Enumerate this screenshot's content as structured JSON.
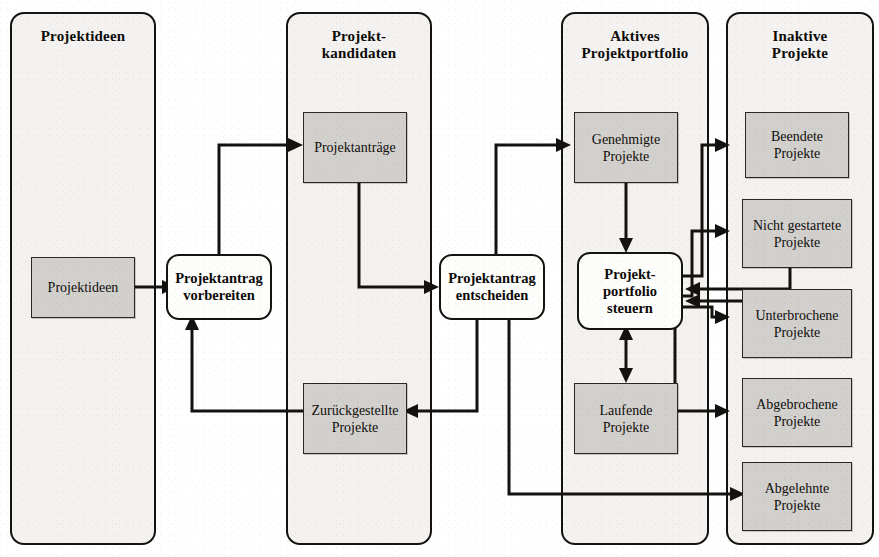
{
  "diagram": {
    "type": "swimlane-flow",
    "colors": {
      "lane_fill": "#f3f2f0",
      "lane_border": "#15130f",
      "node_fill": "#d2d0cd",
      "node_border": "#2a2724",
      "activity_fill": "#fdfdfc",
      "activity_border": "#15130f",
      "connector": "#141210",
      "page_background": "#ffffff"
    }
  },
  "lanes": [
    {
      "id": "lane-projektideen",
      "title": "Projektideen"
    },
    {
      "id": "lane-projektkandidaten",
      "title_line1": "Projekt-",
      "title_line2": "kandidaten"
    },
    {
      "id": "lane-aktives-portfolio",
      "title_line1": "Aktives",
      "title_line2": "Projektportfolio"
    },
    {
      "id": "lane-inaktive-projekte",
      "title_line1": "Inaktive",
      "title_line2": "Projekte"
    }
  ],
  "nodes": {
    "projektideen": {
      "label": "Projektideen"
    },
    "projektantraege": {
      "label": "Projektanträge"
    },
    "zurueckgestellte": {
      "line1": "Zurückgestellte",
      "line2": "Projekte"
    },
    "genehmigte": {
      "line1": "Genehmigte",
      "line2": "Projekte"
    },
    "laufende": {
      "line1": "Laufende",
      "line2": "Projekte"
    },
    "beendete": {
      "line1": "Beendete",
      "line2": "Projekte"
    },
    "nicht_gestartete": {
      "line1": "Nicht gestartete",
      "line2": "Projekte"
    },
    "unterbrochene": {
      "line1": "Unterbrochene",
      "line2": "Projekte"
    },
    "abgebrochene": {
      "line1": "Abgebrochene",
      "line2": "Projekte"
    },
    "abgelehnte": {
      "line1": "Abgelehnte",
      "line2": "Projekte"
    }
  },
  "activities": {
    "antrag_vorbereiten": {
      "line1": "Projektantrag",
      "line2": "vorbereiten"
    },
    "antrag_entscheiden": {
      "line1": "Projektantrag",
      "line2": "entscheiden"
    },
    "portfolio_steuern": {
      "line1": "Projekt-",
      "line2": "portfolio",
      "line3": "steuern"
    }
  },
  "connections": [
    {
      "from": "projektideen",
      "to": "antrag_vorbereiten",
      "style": "straight-right"
    },
    {
      "from": "antrag_vorbereiten",
      "to": "projektantraege",
      "style": "up-right"
    },
    {
      "from": "projektantraege",
      "to": "antrag_entscheiden",
      "style": "down-right"
    },
    {
      "from": "antrag_entscheiden",
      "to": "zurueckgestellte",
      "style": "down-left"
    },
    {
      "from": "zurueckgestellte",
      "to": "antrag_vorbereiten",
      "style": "left-up"
    },
    {
      "from": "antrag_entscheiden",
      "to": "genehmigte",
      "style": "up-right"
    },
    {
      "from": "antrag_entscheiden",
      "to": "abgelehnte",
      "style": "down-right"
    },
    {
      "from": "genehmigte",
      "to": "portfolio_steuern",
      "style": "straight-down"
    },
    {
      "from": "portfolio_steuern",
      "to": "laufende",
      "style": "bidirectional-vertical"
    },
    {
      "from": "portfolio_steuern",
      "to": "beendete",
      "style": "right-up-right"
    },
    {
      "from": "portfolio_steuern",
      "to": "nicht_gestartete",
      "style": "right-up-right"
    },
    {
      "from": "portfolio_steuern",
      "to": "unterbrochene",
      "style": "right-down-right"
    },
    {
      "from": "portfolio_steuern",
      "to": "abgebrochene",
      "style": "right-down-right"
    },
    {
      "from": "nicht_gestartete",
      "to": "portfolio_steuern",
      "style": "feedback-left"
    },
    {
      "from": "unterbrochene",
      "to": "portfolio_steuern",
      "style": "feedback-left"
    }
  ]
}
